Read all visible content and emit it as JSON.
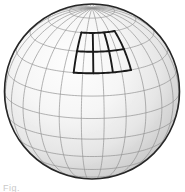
{
  "figure": {
    "kind": "3d-sphere-graticule",
    "background_color": "#ffffff",
    "caption_sliver": "Fig."
  },
  "sphere": {
    "center_x": 92,
    "center_y": 91.5,
    "radius": 87.5,
    "outline_color": "#262626",
    "outline_width": 1.6,
    "surface_light_color": "#fdfdfd",
    "surface_mid_color": "#ededed",
    "surface_dark_color": "#b4b4b4",
    "highlight_offset_x": 0.38,
    "highlight_offset_y": 0.34,
    "highlight_radius": 0.78
  },
  "graticule": {
    "grid_color": "#8e8e8e",
    "grid_width": 0.7,
    "grid_opacity": 0.95,
    "meridian_step_deg": 15,
    "parallel_step_deg": 15,
    "meridian_count": 24,
    "parallel_count": 11,
    "view_rotation_deg": 8,
    "view_tilt_deg": 18,
    "lat_range": [
      -75,
      75
    ],
    "lon_range": [
      -180,
      180
    ]
  },
  "patch": {
    "label": "highlighted-region",
    "color": "#1a1a1a",
    "line_width": 1.9,
    "columns": 3,
    "rows": 2,
    "lon_start_deg": -22,
    "lon_end_deg": 23,
    "lat_start_deg": 30,
    "lat_end_deg": 60,
    "bbox_px": {
      "x": 70,
      "y": 47,
      "width": 60,
      "height": 45
    }
  },
  "chart_data": {
    "type": "scatter",
    "xlabel": "longitude (deg)",
    "ylabel": "latitude (deg)",
    "xlim": [
      -180,
      180
    ],
    "ylim": [
      -90,
      90
    ],
    "grid": true,
    "legend": "none",
    "series": [
      {
        "name": "graticule-meridians",
        "values": [
          -180,
          -165,
          -150,
          -135,
          -120,
          -105,
          -90,
          -75,
          -60,
          -45,
          -30,
          -15,
          0,
          15,
          30,
          45,
          60,
          75,
          90,
          105,
          120,
          135,
          150,
          165
        ]
      },
      {
        "name": "graticule-parallels",
        "values": [
          -75,
          -60,
          -45,
          -30,
          -15,
          0,
          15,
          30,
          45,
          60,
          75
        ]
      },
      {
        "name": "patch-lon-edges",
        "values": [
          -22,
          -7,
          8,
          23
        ]
      },
      {
        "name": "patch-lat-edges",
        "values": [
          30,
          45,
          60
        ]
      }
    ]
  }
}
